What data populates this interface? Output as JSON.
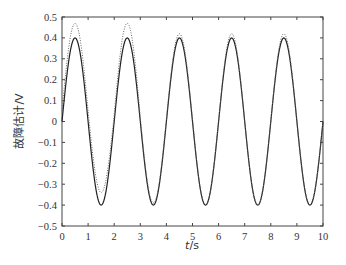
{
  "chart_data": {
    "type": "line",
    "title": "",
    "xlabel": "t/s",
    "ylabel": "故障估计/V",
    "xlim": [
      0,
      10
    ],
    "ylim": [
      -0.5,
      0.5
    ],
    "xticks": [
      0,
      1,
      2,
      3,
      4,
      5,
      6,
      7,
      8,
      9,
      10
    ],
    "xtick_labels": [
      "0",
      "1",
      "2",
      "3",
      "4",
      "5",
      "6",
      "7",
      "8",
      "9",
      "10"
    ],
    "yticks": [
      0.5,
      0.4,
      0.3,
      0.2,
      0.1,
      0,
      -0.1,
      -0.2,
      -0.3,
      -0.4,
      -0.5
    ],
    "ytick_labels": [
      "0.5",
      "0.4",
      "0.3",
      "0.2",
      "0.1",
      "0",
      "−0.1",
      "−0.2",
      "−0.3",
      "−0.4",
      "−0.5"
    ],
    "grid": false,
    "legend": null,
    "series": [
      {
        "name": "actual fault",
        "style": "solid",
        "color": "#222222",
        "description": "0.4*sin(pi*t)",
        "x": [
          0,
          0.5,
          1.0,
          1.5,
          2.0,
          2.5,
          3.0,
          3.5,
          4.0,
          4.5,
          5.0,
          5.5,
          6.0,
          6.5,
          7.0,
          7.5,
          8.0,
          8.5,
          9.0,
          9.5,
          10.0
        ],
        "values": [
          0,
          0.4,
          0,
          -0.4,
          0,
          0.4,
          0,
          -0.4,
          0,
          0.4,
          0,
          -0.4,
          0,
          0.4,
          0,
          -0.4,
          0,
          0.4,
          0,
          -0.4,
          0
        ]
      },
      {
        "name": "fault estimate",
        "style": "dotted",
        "color": "#666666",
        "x": [
          0,
          0.5,
          1.0,
          1.5,
          2.0,
          2.5,
          3.0,
          3.5,
          4.0,
          4.5,
          5.0,
          5.5,
          6.0,
          6.5,
          7.0,
          7.5,
          8.0,
          8.5,
          9.0,
          9.5,
          10.0
        ],
        "values": [
          0.05,
          0.47,
          0.05,
          -0.34,
          0.03,
          0.47,
          0.02,
          -0.39,
          0.01,
          0.42,
          0.01,
          -0.4,
          0.0,
          0.42,
          0.0,
          -0.4,
          0.0,
          0.42,
          0.0,
          -0.4,
          0.0
        ]
      }
    ]
  },
  "layout": {
    "plot_left": 62,
    "plot_right": 323,
    "plot_top": 17,
    "plot_bottom": 226
  }
}
